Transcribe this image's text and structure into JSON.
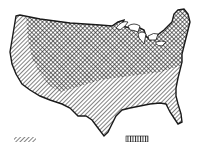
{
  "map": {
    "subject": "Contiguous United States",
    "regions": [
      {
        "id": "north-central",
        "pattern": "crosshatch",
        "description": "Northern and central states region"
      },
      {
        "id": "south-west",
        "pattern": "diagonal-hatch",
        "description": "Southern tier and Pacific coast region"
      }
    ],
    "colors": {
      "ink": "#1a1a1a",
      "paper": "#ffffff"
    }
  },
  "legend": {
    "swatches": [
      {
        "pattern": "diagonal-hatch",
        "position": "bottom-left"
      },
      {
        "pattern": "vertical-hatch",
        "position": "bottom-center"
      }
    ]
  }
}
